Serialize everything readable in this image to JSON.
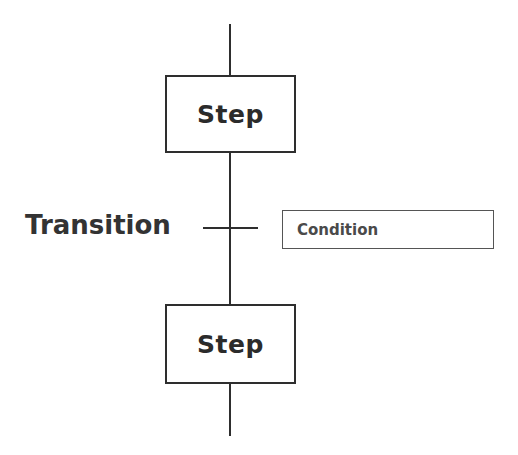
{
  "diagram": {
    "type": "sfc-grafcet",
    "steps": [
      {
        "label": "Step"
      },
      {
        "label": "Step"
      }
    ],
    "transition": {
      "label": "Transition",
      "condition": "Condition"
    },
    "colors": {
      "line": "#2e2e2e",
      "text": "#2b2b2b",
      "background": "#ffffff"
    }
  }
}
